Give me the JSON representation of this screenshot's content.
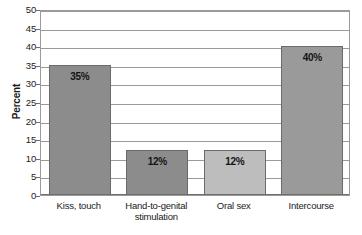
{
  "chart_data": {
    "type": "bar",
    "title": "",
    "xlabel": "",
    "ylabel": "Percent",
    "ylim": [
      0,
      50
    ],
    "ytick_step": 5,
    "yticks": [
      50,
      45,
      40,
      35,
      30,
      25,
      20,
      15,
      10,
      5,
      0
    ],
    "grid": true,
    "legend": "none",
    "categories": [
      "Kiss, touch",
      "Hand-to-genital stimulation",
      "Oral sex",
      "Intercourse"
    ],
    "values": [
      35,
      12,
      12,
      40
    ],
    "data_labels": [
      "35%",
      "12%",
      "12%",
      "40%"
    ],
    "bar_colors": [
      "#8c8c8c",
      "#8c8c8c",
      "#bdbdbd",
      "#9a9a9a"
    ]
  },
  "category_lines": [
    [
      "Kiss, touch"
    ],
    [
      "Hand-to-genital",
      "stimulation"
    ],
    [
      "Oral sex"
    ],
    [
      "Intercourse"
    ]
  ],
  "style": {
    "background": "#ffffff",
    "axis_color": "#6e6e6e",
    "grid_color": "#9a9a9a",
    "bar_border": "#6b6b6b",
    "text_color": "#1a1a1a"
  }
}
